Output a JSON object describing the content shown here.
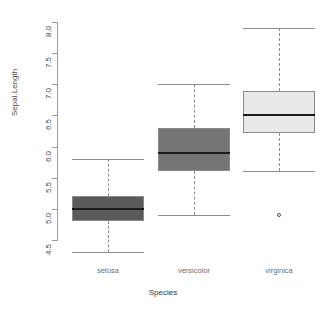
{
  "chart_data": {
    "type": "box",
    "title": "",
    "xlabel": "Species",
    "ylabel": "Sepal.Length",
    "categories": [
      "setosa",
      "versicolor",
      "virginica"
    ],
    "ylim": [
      4.3,
      8.0
    ],
    "yticks": [
      "4.5",
      "5.0",
      "5.5",
      "6.0",
      "6.5",
      "7.0",
      "7.5",
      "8.0"
    ],
    "ytick_values": [
      4.5,
      5.0,
      5.5,
      6.0,
      6.5,
      7.0,
      7.5,
      8.0
    ],
    "grid": false,
    "legend": "none",
    "boxes": [
      {
        "name": "setosa",
        "min": 4.3,
        "q1": 4.8,
        "median": 5.0,
        "q3": 5.2,
        "max": 5.8,
        "outliers": [],
        "fill": "#5a5a5a"
      },
      {
        "name": "versicolor",
        "min": 4.9,
        "q1": 5.6,
        "median": 5.9,
        "q3": 6.3,
        "max": 7.0,
        "outliers": [],
        "fill": "#757575"
      },
      {
        "name": "virginica",
        "min": 5.6,
        "q1": 6.225,
        "median": 6.5,
        "q3": 6.9,
        "max": 7.9,
        "outliers": [
          4.9
        ],
        "fill": "#e8e8e8"
      }
    ]
  },
  "axes": {
    "y_title": "Sepal.Length",
    "x_title": "Species",
    "y_tick_labels": [
      "4.5",
      "5.0",
      "5.5",
      "6.0",
      "6.5",
      "7.0",
      "7.5",
      "8.0"
    ],
    "x_tick_labels": [
      "setosa",
      "versicolor",
      "virginica"
    ]
  },
  "colors": {
    "axis": "#9a9a9a",
    "tick_text": "#4d4d4d",
    "category_text": "#6e6e6e",
    "median_line": "#1b1b1b",
    "box_border": "#8a8a8a",
    "whisker": "#8d8d8d",
    "background": "#ffffff"
  }
}
